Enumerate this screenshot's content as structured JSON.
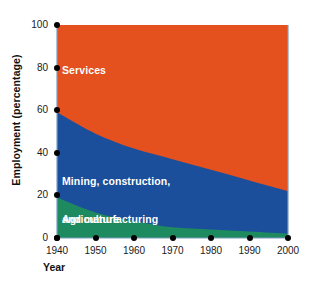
{
  "chart_data": {
    "type": "area",
    "stacked": true,
    "title": "",
    "xlabel": "Year",
    "ylabel": "Employment (percentage)",
    "x": [
      1940,
      1950,
      1960,
      1970,
      1980,
      1990,
      2000
    ],
    "xlim": [
      1940,
      2000
    ],
    "ylim": [
      0,
      100
    ],
    "xticks": [
      1940,
      1950,
      1960,
      1970,
      1980,
      1990,
      2000
    ],
    "yticks": [
      0,
      20,
      40,
      60,
      80,
      100
    ],
    "grid": false,
    "legend_position": "inline-labels",
    "series": [
      {
        "name": "Agriculture",
        "color": "#1E8A5F",
        "values": [
          19,
          12,
          8,
          5,
          4,
          3,
          2
        ]
      },
      {
        "name": "Mining, construction, and manufacturing",
        "color": "#1B4F9C",
        "values": [
          40,
          37,
          34,
          32,
          28,
          24,
          20
        ]
      },
      {
        "name": "Services",
        "color": "#E4511E",
        "values": [
          41,
          51,
          58,
          63,
          68,
          73,
          78
        ]
      }
    ],
    "cumulative_tops": {
      "agriculture": [
        19,
        12,
        8,
        5,
        4,
        3,
        2
      ],
      "mining_construction_manufacturing": [
        59,
        49,
        42,
        37,
        32,
        27,
        22
      ],
      "services": [
        100,
        100,
        100,
        100,
        100,
        100,
        100
      ]
    },
    "annotations": [
      {
        "text": "Services",
        "x": 1942,
        "y": 80
      },
      {
        "text": "Mining, construction,\nand manufacturing",
        "x": 1942,
        "y": 33
      },
      {
        "text": "Agriculture",
        "x": 1942,
        "y": 9
      }
    ]
  },
  "axes": {
    "y_title": "Employment (percentage)",
    "x_title": "Year",
    "y_tick_labels": [
      "0",
      "20",
      "40",
      "60",
      "80",
      "100"
    ],
    "x_tick_labels": [
      "1940",
      "1950",
      "1960",
      "1970",
      "1980",
      "1990",
      "2000"
    ]
  },
  "labels": {
    "services": "Services",
    "mining_line1": "Mining, construction,",
    "mining_line2": "and manufacturing",
    "agriculture": "Agriculture"
  },
  "colors": {
    "services": "#E4511E",
    "mining": "#1B4F9C",
    "agriculture": "#1E8A5F",
    "axis": "#7c9ec4",
    "text": "#1a1a1a",
    "background": "#ffffff"
  }
}
